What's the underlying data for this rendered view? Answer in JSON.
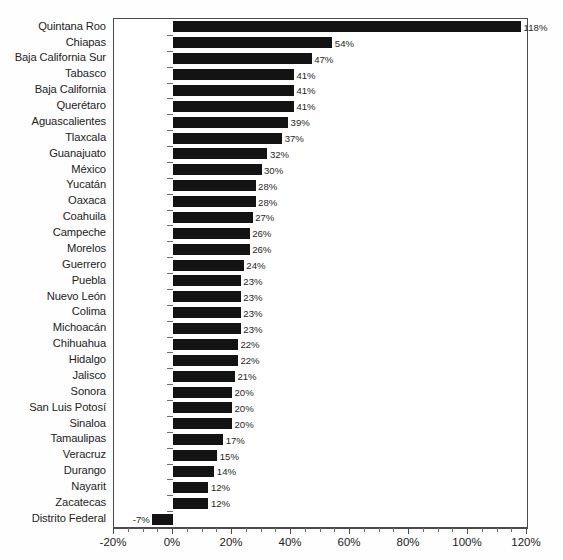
{
  "chart_data": {
    "type": "bar",
    "orientation": "horizontal",
    "title": "",
    "subtitle": "",
    "xlabel": "",
    "ylabel": "",
    "xlim": [
      -20,
      120
    ],
    "xtick_labels": [
      "-20%",
      "0%",
      "20%",
      "40%",
      "60%",
      "80%",
      "100%",
      "120%"
    ],
    "xtick_values": [
      -20,
      0,
      20,
      40,
      60,
      80,
      100,
      120
    ],
    "minor_tick_step": 5,
    "grid": false,
    "legend": null,
    "value_label_suffix": "%",
    "bar_color": "#131313",
    "categories": [
      "Quintana Roo",
      "Chiapas",
      "Baja California Sur",
      "Tabasco",
      "Baja California",
      "Querétaro",
      "Aguascalientes",
      "Tlaxcala",
      "Guanajuato",
      "México",
      "Yucatán",
      "Oaxaca",
      "Coahuila",
      "Campeche",
      "Morelos",
      "Guerrero",
      "Puebla",
      "Nuevo León",
      "Colima",
      "Michoacán",
      "Chihuahua",
      "Hidalgo",
      "Jalisco",
      "Sonora",
      "San Luis Potosí",
      "Sinaloa",
      "Tamaulipas",
      "Veracruz",
      "Durango",
      "Nayarit",
      "Zacatecas",
      "Distrito Federal"
    ],
    "values": [
      118,
      54,
      47,
      41,
      41,
      41,
      39,
      37,
      32,
      30,
      28,
      28,
      27,
      26,
      26,
      24,
      23,
      23,
      23,
      23,
      22,
      22,
      21,
      20,
      20,
      20,
      17,
      15,
      14,
      12,
      12,
      -7
    ],
    "value_labels": [
      "118%",
      "54%",
      "47%",
      "41%",
      "41%",
      "41%",
      "39%",
      "37%",
      "32%",
      "30%",
      "28%",
      "28%",
      "27%",
      "26%",
      "26%",
      "24%",
      "23%",
      "23%",
      "23%",
      "23%",
      "22%",
      "22%",
      "21%",
      "20%",
      "20%",
      "20%",
      "17%",
      "15%",
      "14%",
      "12%",
      "12%",
      "-7%"
    ]
  }
}
